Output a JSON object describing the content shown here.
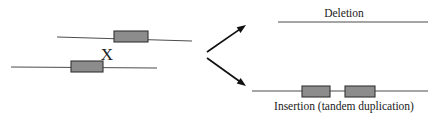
{
  "figure": {
    "title_visible": false,
    "background_color": "#ffffff",
    "line_color": "#4d4d4d",
    "box_fill_color": "#8c8c8c",
    "box_stroke_color": "#333333",
    "arrow_color": "#111111",
    "text_color": "#1a1a1a"
  },
  "parent": {
    "crossover_marker": "X",
    "top_chromosome": {
      "name": "top-chromosome",
      "line": {
        "x1": 57,
        "y1": 37,
        "x2": 192,
        "y2": 41
      },
      "segment": {
        "x": 114,
        "y": 31,
        "width": 34,
        "height": 11
      }
    },
    "bottom_chromosome": {
      "name": "bottom-chromosome",
      "line": {
        "x1": 11,
        "y1": 67,
        "x2": 157,
        "y2": 68
      },
      "segment": {
        "x": 71,
        "y": 61,
        "width": 32,
        "height": 11
      }
    },
    "crossover": {
      "x": 107,
      "y": 60
    }
  },
  "arrows": [
    {
      "name": "arrow-to-deletion",
      "x1": 207,
      "y1": 52,
      "x2": 246,
      "y2": 25
    },
    {
      "name": "arrow-to-insertion",
      "x1": 207,
      "y1": 58,
      "x2": 246,
      "y2": 86
    }
  ],
  "outcomes": [
    {
      "id": "deletion",
      "label": "Deletion",
      "label_position": "above",
      "label_x": 344,
      "label_y": 17,
      "line": {
        "x1": 278,
        "y1": 22,
        "x2": 428,
        "y2": 22
      },
      "segments": []
    },
    {
      "id": "insertion",
      "label": "Insertion (tandem duplication)",
      "label_position": "below",
      "label_x": 344,
      "label_y": 110,
      "line": {
        "x1": 252,
        "y1": 91,
        "x2": 428,
        "y2": 91
      },
      "segments": [
        {
          "name": "duplicated-segment-1",
          "x": 302,
          "y": 86,
          "width": 28,
          "height": 11
        },
        {
          "name": "duplicated-segment-2",
          "x": 345,
          "y": 86,
          "width": 30,
          "height": 11
        }
      ]
    }
  ]
}
